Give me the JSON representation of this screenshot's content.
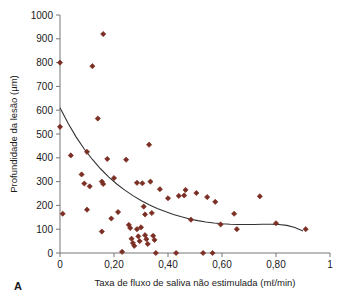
{
  "figure": {
    "panel_label": "A"
  },
  "chart_data": {
    "type": "scatter",
    "title": "",
    "xlabel": "Taxa de fluxo de saliva não estimulada (mℓ/min)",
    "ylabel": "Profundidade da lesão (µm)",
    "xlim": [
      0,
      1
    ],
    "ylim": [
      0,
      1000
    ],
    "grid": false,
    "legend": "none",
    "marker": "diamond",
    "marker_color": "#7B2E23",
    "xticks": [
      0,
      0.2,
      0.4,
      0.6,
      0.8,
      1
    ],
    "xticklabels": [
      "0",
      "0,20",
      "0,40",
      "0,60",
      "0,80",
      "1"
    ],
    "yticks": [
      0,
      100,
      200,
      300,
      400,
      500,
      600,
      700,
      800,
      900,
      1000
    ],
    "yticklabels": [
      "0",
      "100",
      "200",
      "300",
      "400",
      "500",
      "600",
      "700",
      "800",
      "900",
      "1000"
    ],
    "series": [
      {
        "name": "Lesões",
        "points": [
          [
            0.0,
            800
          ],
          [
            0.0,
            530
          ],
          [
            0.01,
            165
          ],
          [
            0.04,
            410
          ],
          [
            0.08,
            330
          ],
          [
            0.09,
            292
          ],
          [
            0.1,
            425
          ],
          [
            0.1,
            182
          ],
          [
            0.11,
            280
          ],
          [
            0.12,
            785
          ],
          [
            0.16,
            920
          ],
          [
            0.14,
            565
          ],
          [
            0.155,
            300
          ],
          [
            0.16,
            290
          ],
          [
            0.155,
            90
          ],
          [
            0.175,
            395
          ],
          [
            0.19,
            145
          ],
          [
            0.2,
            315
          ],
          [
            0.215,
            172
          ],
          [
            0.23,
            5
          ],
          [
            0.245,
            392
          ],
          [
            0.255,
            118
          ],
          [
            0.26,
            105
          ],
          [
            0.265,
            60
          ],
          [
            0.27,
            42
          ],
          [
            0.275,
            30
          ],
          [
            0.285,
            295
          ],
          [
            0.285,
            100
          ],
          [
            0.29,
            70
          ],
          [
            0.295,
            50
          ],
          [
            0.3,
            108
          ],
          [
            0.305,
            293
          ],
          [
            0.31,
            195
          ],
          [
            0.315,
            162
          ],
          [
            0.315,
            75
          ],
          [
            0.32,
            58
          ],
          [
            0.325,
            38
          ],
          [
            0.33,
            455
          ],
          [
            0.335,
            300
          ],
          [
            0.34,
            168
          ],
          [
            0.345,
            72
          ],
          [
            0.35,
            55
          ],
          [
            0.355,
            0
          ],
          [
            0.37,
            268
          ],
          [
            0.4,
            230
          ],
          [
            0.43,
            0
          ],
          [
            0.44,
            240
          ],
          [
            0.46,
            242
          ],
          [
            0.465,
            265
          ],
          [
            0.485,
            140
          ],
          [
            0.505,
            252
          ],
          [
            0.53,
            0
          ],
          [
            0.545,
            235
          ],
          [
            0.565,
            0
          ],
          [
            0.575,
            215
          ],
          [
            0.595,
            120
          ],
          [
            0.645,
            165
          ],
          [
            0.655,
            100
          ],
          [
            0.74,
            238
          ],
          [
            0.8,
            125
          ],
          [
            0.91,
            100
          ]
        ]
      }
    ],
    "fit_curve": {
      "name": "Curva de ajuste",
      "color": "#333333",
      "points": [
        [
          0.0,
          610
        ],
        [
          0.03,
          545
        ],
        [
          0.06,
          487
        ],
        [
          0.09,
          437
        ],
        [
          0.12,
          393
        ],
        [
          0.15,
          354
        ],
        [
          0.18,
          320
        ],
        [
          0.21,
          290
        ],
        [
          0.24,
          264
        ],
        [
          0.27,
          241
        ],
        [
          0.3,
          221
        ],
        [
          0.33,
          203
        ],
        [
          0.36,
          187
        ],
        [
          0.39,
          174
        ],
        [
          0.42,
          162
        ],
        [
          0.45,
          152
        ],
        [
          0.48,
          143
        ],
        [
          0.51,
          136
        ],
        [
          0.54,
          130
        ],
        [
          0.57,
          126
        ],
        [
          0.6,
          123
        ],
        [
          0.63,
          121
        ],
        [
          0.66,
          120
        ],
        [
          0.69,
          120
        ],
        [
          0.72,
          120
        ],
        [
          0.75,
          121
        ],
        [
          0.78,
          121
        ],
        [
          0.81,
          120
        ],
        [
          0.84,
          116
        ],
        [
          0.87,
          107
        ],
        [
          0.9,
          92
        ]
      ]
    }
  }
}
